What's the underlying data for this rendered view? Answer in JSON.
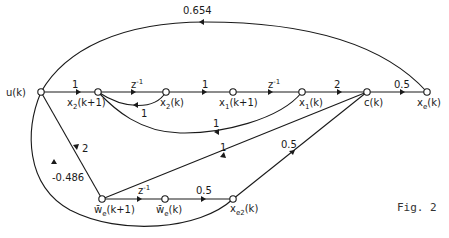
{
  "figure": {
    "caption": "Fig. 2",
    "type": "signal flow graph"
  },
  "nodes": [
    {
      "id": "u",
      "label": "u(k)"
    },
    {
      "id": "x2k1",
      "label": "x2(k+1)"
    },
    {
      "id": "x2k",
      "label": "x2(k)"
    },
    {
      "id": "x1k1",
      "label": "x1(k+1)"
    },
    {
      "id": "x1k",
      "label": "x1(k)"
    },
    {
      "id": "c",
      "label": "c(k)"
    },
    {
      "id": "xe",
      "label": "xe(k)"
    },
    {
      "id": "wek1",
      "label": "w̄e(k+1)"
    },
    {
      "id": "wek",
      "label": "w̄e(k)"
    },
    {
      "id": "xe2",
      "label": "xe2(k)"
    }
  ],
  "edges": [
    {
      "from": "u",
      "to": "x2k1",
      "gain": "1"
    },
    {
      "from": "x2k1",
      "to": "x2k",
      "gain": "z⁻¹"
    },
    {
      "from": "x2k",
      "to": "x2k1",
      "gain": "1"
    },
    {
      "from": "x2k",
      "to": "x1k1",
      "gain": "1"
    },
    {
      "from": "x1k1",
      "to": "x1k",
      "gain": "z⁻¹"
    },
    {
      "from": "x1k",
      "to": "x2k1",
      "gain": "1"
    },
    {
      "from": "x1k",
      "to": "c",
      "gain": "2"
    },
    {
      "from": "c",
      "to": "xe",
      "gain": "0.5"
    },
    {
      "from": "xe",
      "to": "u",
      "gain": "0.654"
    },
    {
      "from": "u",
      "to": "wek1",
      "gain": "2"
    },
    {
      "from": "c",
      "to": "wek1",
      "gain": "1"
    },
    {
      "from": "wek1",
      "to": "wek",
      "gain": "z⁻¹"
    },
    {
      "from": "wek",
      "to": "xe2",
      "gain": "0.5"
    },
    {
      "from": "xe2",
      "to": "c",
      "gain": "0.5"
    },
    {
      "from": "xe2",
      "to": "u",
      "gain": "-0.486"
    }
  ],
  "labels": {
    "u": "u(k)",
    "x2k1_main": "x",
    "x2k1_sub": "2",
    "x2k1_tail": "(k+1)",
    "x2k_main": "x",
    "x2k_sub": "2",
    "x2k_tail": "(k)",
    "x1k1_main": "x",
    "x1k1_sub": "1",
    "x1k1_tail": "(k+1)",
    "x1k_main": "x",
    "x1k_sub": "1",
    "x1k_tail": "(k)",
    "c": "c(k)",
    "xe_main": "x",
    "xe_sub": "e",
    "xe_tail": "(k)",
    "wek1_main": "w̄",
    "wek1_sub": "e",
    "wek1_tail": "(k+1)",
    "wek_main": "w̄",
    "wek_sub": "e",
    "wek_tail": "(k)",
    "xe2_main": "x",
    "xe2_sub": "e2",
    "xe2_tail": "(k)"
  },
  "gains": {
    "u_x2k1": "1",
    "x2k1_x2k": "z",
    "x2k1_x2k_exp": "-1",
    "x2k_x2k1": "1",
    "x2k_x1k1": "1",
    "x1k1_x1k": "z",
    "x1k1_x1k_exp": "-1",
    "x1k_x2k1": "1",
    "x1k_c": "2",
    "c_xe": "0.5",
    "xe_u": "0.654",
    "u_wek1": "2",
    "c_wek1": "1",
    "wek1_wek": "z",
    "wek1_wek_exp": "-1",
    "wek_xe2": "0.5",
    "xe2_c": "0.5",
    "xe2_u": "-0.486"
  }
}
